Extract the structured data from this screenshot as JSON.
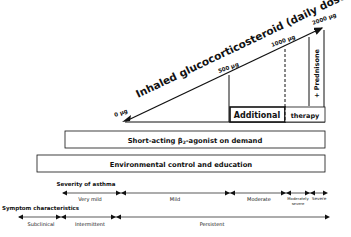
{
  "diagram": {
    "steroid_axis": {
      "label": "Inhaled glucocorticosteroid (daily dose)",
      "doses": [
        "0 µg",
        "500 µg",
        "1000 µg",
        "2000 µg"
      ]
    },
    "additional_therapy": {
      "left": "Additional",
      "right": "therapy",
      "prednisone": "+ Prednisone"
    },
    "boxes": {
      "short_acting_prefix": "Short-acting β",
      "short_acting_sub": "2",
      "short_acting_suffix": "-agonist on demand",
      "environmental": "Environmental control and education"
    },
    "severity": {
      "title": "Severity of asthma",
      "levels": [
        "Very mild",
        "Mild",
        "Moderate",
        "Moderately",
        "severe",
        "Severe"
      ]
    },
    "symptoms": {
      "title": "Symptom characteristics",
      "levels": [
        "Subclinical",
        "Intermittent",
        "Persistent"
      ]
    }
  }
}
